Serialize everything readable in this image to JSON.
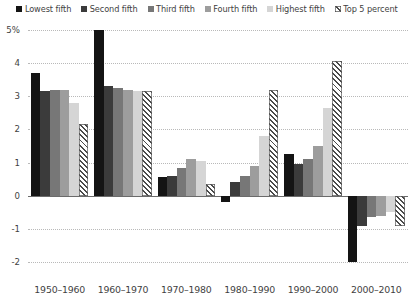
{
  "chart_data": {
    "type": "bar",
    "title": "",
    "subtitle": "",
    "xlabel": "",
    "ylabel": "",
    "ylim": [
      -2,
      5
    ],
    "yticks": [
      5,
      4,
      3,
      2,
      1,
      0,
      -1,
      -2
    ],
    "ytick_labels": [
      "5%",
      "4",
      "3",
      "2",
      "1",
      "0",
      "-1",
      "-2"
    ],
    "grid": true,
    "legend_position": "top",
    "categories": [
      "1950–1960",
      "1960–1970",
      "1970–1980",
      "1980–1990",
      "1990–2000",
      "2000–2010"
    ],
    "series": [
      {
        "name": "Lowest fifth",
        "color": "#141414",
        "pattern": "solid",
        "values": [
          3.7,
          5.0,
          0.55,
          -0.2,
          1.25,
          -2.0
        ]
      },
      {
        "name": "Second fifth",
        "color": "#3b3b3b",
        "pattern": "solid",
        "values": [
          3.15,
          3.3,
          0.6,
          0.4,
          0.95,
          -0.9
        ]
      },
      {
        "name": "Third fifth",
        "color": "#777777",
        "pattern": "solid",
        "values": [
          3.2,
          3.25,
          0.85,
          0.6,
          1.1,
          -0.65
        ]
      },
      {
        "name": "Fourth fifth",
        "color": "#9d9d9d",
        "pattern": "solid",
        "values": [
          3.2,
          3.2,
          1.1,
          0.9,
          1.5,
          -0.6
        ]
      },
      {
        "name": "Highest fifth",
        "color": "#d5d5d5",
        "pattern": "solid",
        "values": [
          2.8,
          3.15,
          1.05,
          1.8,
          2.65,
          -0.5
        ]
      },
      {
        "name": "Top 5 percent",
        "color": "#4a4a4a",
        "pattern": "diagonal-hatch",
        "values": [
          2.15,
          3.15,
          0.35,
          3.2,
          4.05,
          -0.9
        ]
      }
    ]
  },
  "legend": {
    "items": [
      {
        "label": "Lowest fifth"
      },
      {
        "label": "Second fifth"
      },
      {
        "label": "Third fifth"
      },
      {
        "label": "Fourth fifth"
      },
      {
        "label": "Highest fifth"
      },
      {
        "label": "Top 5 percent"
      }
    ]
  }
}
